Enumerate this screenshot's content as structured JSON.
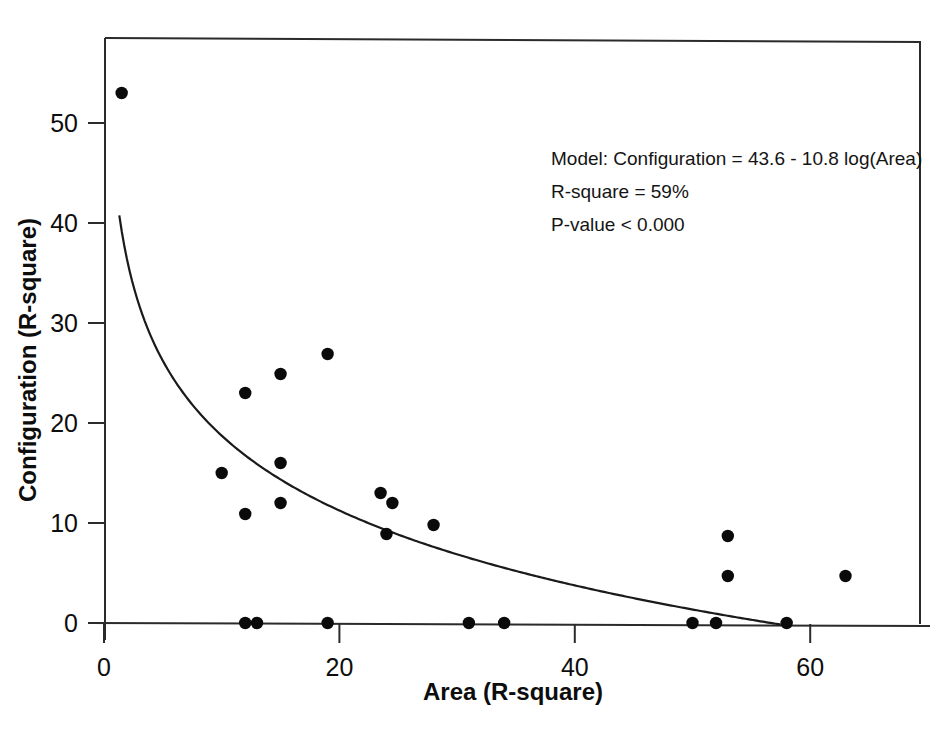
{
  "chart_data": {
    "type": "scatter",
    "title": "",
    "xlabel": "Area (R-square)",
    "ylabel": "Configuration (R-square)",
    "xlim": [
      -1.5,
      69.5
    ],
    "ylim": [
      -1.5,
      58.5
    ],
    "xticks": [
      0,
      20,
      40,
      60
    ],
    "yticks": [
      0,
      10,
      20,
      30,
      40,
      50
    ],
    "grid": false,
    "legend": null,
    "points": [
      {
        "x": 1.5,
        "y": 53.0
      },
      {
        "x": 10.0,
        "y": 15.0
      },
      {
        "x": 12.0,
        "y": 23.0
      },
      {
        "x": 12.0,
        "y": 10.9
      },
      {
        "x": 12.0,
        "y": 0.0
      },
      {
        "x": 13.0,
        "y": 0.0
      },
      {
        "x": 15.0,
        "y": 24.9
      },
      {
        "x": 15.0,
        "y": 16.0
      },
      {
        "x": 15.0,
        "y": 12.0
      },
      {
        "x": 19.0,
        "y": 26.9
      },
      {
        "x": 19.0,
        "y": 0.0
      },
      {
        "x": 23.5,
        "y": 13.0
      },
      {
        "x": 24.5,
        "y": 12.0
      },
      {
        "x": 24.0,
        "y": 8.9
      },
      {
        "x": 28.0,
        "y": 9.8
      },
      {
        "x": 31.0,
        "y": 0.0
      },
      {
        "x": 34.0,
        "y": 0.0
      },
      {
        "x": 50.0,
        "y": 0.0
      },
      {
        "x": 52.0,
        "y": 0.0
      },
      {
        "x": 53.0,
        "y": 8.7
      },
      {
        "x": 53.0,
        "y": 4.7
      },
      {
        "x": 58.0,
        "y": 0.0
      },
      {
        "x": 63.0,
        "y": 4.7
      }
    ],
    "fit_curve": {
      "label": "Configuration = 43.6 - 10.8 log(Area)",
      "intercept": 43.6,
      "slope": -10.8,
      "x_start": 1.3,
      "x_end": 57.5
    },
    "annotations": {
      "model": "Model:  Configuration = 43.6 - 10.8 log(Area)",
      "r_square": "R-square = 59%",
      "p_value": "P-value < 0.000"
    }
  },
  "axis": {
    "x_tick_labels": [
      "0",
      "20",
      "40",
      "60"
    ],
    "y_tick_labels": [
      "0",
      "10",
      "20",
      "30",
      "40",
      "50"
    ],
    "x_title": "Area (R-square)",
    "y_title": "Configuration (R-square)"
  },
  "colors": {
    "point": "#0a0a0a",
    "curve": "#1a1a1a",
    "axis": "#2b2b2b",
    "text": "#0d0d0d",
    "background": "#ffffff"
  }
}
